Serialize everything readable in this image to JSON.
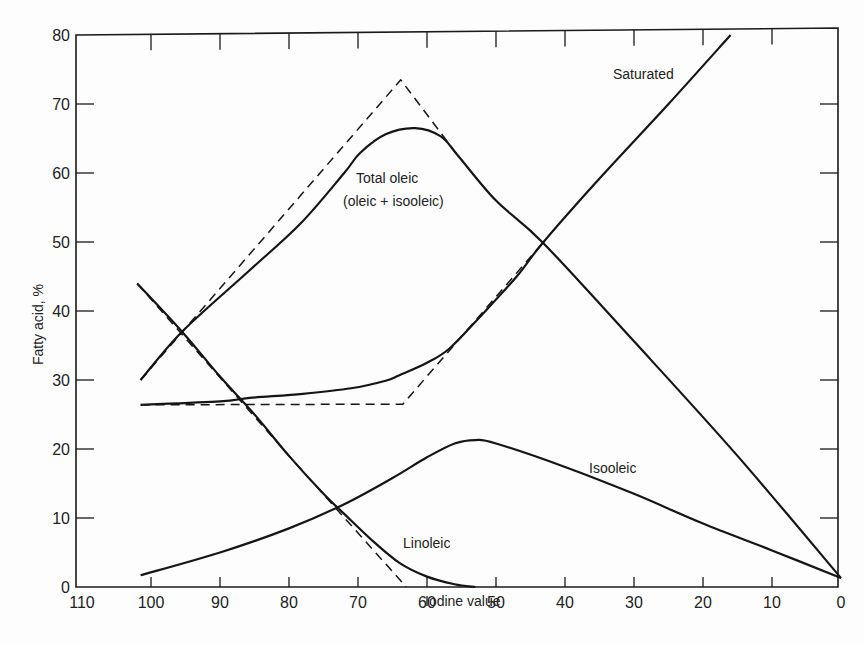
{
  "chart_data": {
    "type": "line",
    "title": "",
    "xlabel": "Iodine value",
    "ylabel": "Fatty acid, %",
    "xlim": [
      110,
      0
    ],
    "ylim": [
      0,
      80
    ],
    "x_reversed": true,
    "grid": false,
    "legend": "none (curves labeled inline)",
    "x_ticks": [
      110,
      100,
      90,
      80,
      70,
      60,
      50,
      40,
      30,
      20,
      10,
      0
    ],
    "y_ticks": [
      0,
      10,
      20,
      30,
      40,
      50,
      60,
      70,
      80
    ],
    "series": [
      {
        "name": "Saturated",
        "style": "solid",
        "points": [
          [
            101.5,
            26.4
          ],
          [
            90,
            26.9
          ],
          [
            85.7,
            27.4
          ],
          [
            78,
            28.0
          ],
          [
            71,
            28.8
          ],
          [
            66,
            29.9
          ],
          [
            64,
            30.7
          ],
          [
            60,
            32.5
          ],
          [
            56.7,
            34.6
          ],
          [
            52,
            39.5
          ],
          [
            47,
            45.0
          ],
          [
            43.2,
            49.9
          ],
          [
            35,
            59.2
          ],
          [
            25,
            70.0
          ],
          [
            16,
            80.0
          ]
        ]
      },
      {
        "name": "Saturated (theoretical)",
        "style": "dashed",
        "points": [
          [
            101.5,
            26.4
          ],
          [
            63.5,
            26.5
          ],
          [
            43.2,
            49.9
          ]
        ]
      },
      {
        "name": "Total oleic (oleic + isooleic)",
        "style": "solid",
        "points": [
          [
            101.5,
            30.0
          ],
          [
            95.5,
            37.0
          ],
          [
            85.7,
            45.9
          ],
          [
            78.4,
            52.6
          ],
          [
            72,
            60.0
          ],
          [
            69.7,
            62.9
          ],
          [
            66,
            65.6
          ],
          [
            61.7,
            66.5
          ],
          [
            58,
            65.3
          ],
          [
            55.5,
            62.5
          ],
          [
            50,
            56.0
          ],
          [
            43.2,
            49.9
          ],
          [
            30,
            35.6
          ],
          [
            15,
            19.0
          ],
          [
            0,
            1.3
          ]
        ]
      },
      {
        "name": "Total oleic (theoretical)",
        "style": "dashed",
        "points": [
          [
            101.5,
            30.0
          ],
          [
            63.8,
            73.5
          ],
          [
            55.5,
            62.5
          ]
        ]
      },
      {
        "name": "Linoleic",
        "style": "solid",
        "points": [
          [
            102,
            44.0
          ],
          [
            95.5,
            37.0
          ],
          [
            90,
            30.5
          ],
          [
            85,
            25.0
          ],
          [
            80,
            19.0
          ],
          [
            75,
            13.5
          ],
          [
            72,
            10.6
          ],
          [
            68,
            6.8
          ],
          [
            64,
            3.5
          ],
          [
            60,
            1.5
          ],
          [
            56,
            0.4
          ],
          [
            53,
            0.0
          ]
        ]
      },
      {
        "name": "Linoleic (theoretical)",
        "style": "dashed",
        "points": [
          [
            102,
            44.0
          ],
          [
            80,
            19.0
          ],
          [
            63,
            0.0
          ]
        ]
      },
      {
        "name": "Isooleic",
        "style": "solid",
        "points": [
          [
            101.5,
            1.7
          ],
          [
            90,
            5.0
          ],
          [
            80,
            8.5
          ],
          [
            72,
            12.0
          ],
          [
            65,
            15.8
          ],
          [
            60,
            18.8
          ],
          [
            56,
            20.8
          ],
          [
            53,
            21.3
          ],
          [
            50,
            20.8
          ],
          [
            40,
            17.4
          ],
          [
            30,
            13.5
          ],
          [
            20,
            9.2
          ],
          [
            10,
            5.3
          ],
          [
            0,
            1.3
          ]
        ]
      }
    ],
    "annotations": [
      {
        "text": "Saturated",
        "x": 31,
        "y": 74
      },
      {
        "text": "Total oleic",
        "x": 67,
        "y": 59
      },
      {
        "text": "(oleic + isooleic)",
        "x": 67,
        "y": 55
      },
      {
        "text": "Linoleic",
        "x": 60,
        "y": 6.5
      },
      {
        "text": "Isooleic",
        "x": 34,
        "y": 17
      }
    ]
  },
  "labels": {
    "xlabel": "Iodine value",
    "ylabel": "Fatty acid, %",
    "saturated": "Saturated",
    "total_oleic_1": "Total oleic",
    "total_oleic_2": "(oleic + isooleic)",
    "linoleic": "Linoleic",
    "isooleic": "Isooleic"
  }
}
